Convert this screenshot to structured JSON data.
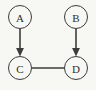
{
  "diagram": {
    "background_color": "#f7f7f4",
    "stroke_color": "#3c3c3c",
    "label_color": "#2e2e2e",
    "width": 96,
    "height": 90,
    "nodes": [
      {
        "id": "A",
        "label": "A",
        "cx": 20,
        "cy": 17,
        "r": 11.5
      },
      {
        "id": "B",
        "label": "B",
        "cx": 76,
        "cy": 17,
        "r": 11.5
      },
      {
        "id": "C",
        "label": "C",
        "cx": 20,
        "cy": 68,
        "r": 11.5
      },
      {
        "id": "D",
        "label": "D",
        "cx": 76,
        "cy": 68,
        "r": 11.5
      }
    ],
    "edges": [
      {
        "id": "a-to-c",
        "from": "A",
        "to": "C",
        "directed": true,
        "orientation": "vertical"
      },
      {
        "id": "b-to-d",
        "from": "B",
        "to": "D",
        "directed": true,
        "orientation": "vertical"
      },
      {
        "id": "c-to-d",
        "from": "C",
        "to": "D",
        "directed": false,
        "orientation": "horizontal"
      }
    ]
  }
}
